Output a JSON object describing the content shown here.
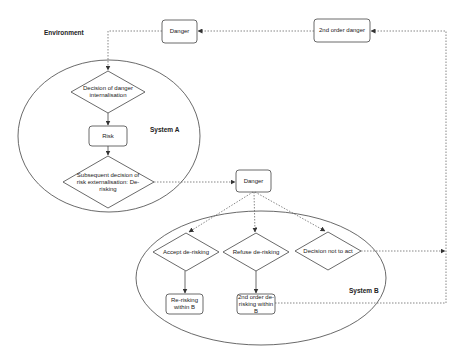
{
  "diagram": {
    "labels": {
      "environment": "Environment",
      "system_a": "System A",
      "system_b": "System B"
    },
    "nodes": {
      "danger_top": "Danger",
      "second_order_danger": "2nd order danger",
      "decision_internalisation": "Decision of danger internalisation",
      "risk": "Risk",
      "subsequent_decision": "Subsequent decision of risk externalisation: De-risking",
      "danger_mid": "Danger",
      "accept": "Accept de-risking",
      "refuse": "Refuse de-risking",
      "not_act": "Decision not to act",
      "re_risking": "Re-risking within B",
      "second_order_derisking": "2nd order de-risking within B"
    },
    "edges": [
      {
        "from": "second_order_danger",
        "to": "danger_top",
        "style": "dotted"
      },
      {
        "from": "danger_top",
        "to": "decision_internalisation",
        "style": "dotted"
      },
      {
        "from": "decision_internalisation",
        "to": "risk",
        "style": "solid"
      },
      {
        "from": "risk",
        "to": "subsequent_decision",
        "style": "solid"
      },
      {
        "from": "subsequent_decision",
        "to": "danger_mid",
        "style": "dotted"
      },
      {
        "from": "danger_mid",
        "to": "accept",
        "style": "dotted"
      },
      {
        "from": "danger_mid",
        "to": "refuse",
        "style": "dotted"
      },
      {
        "from": "danger_mid",
        "to": "not_act",
        "style": "dotted"
      },
      {
        "from": "accept",
        "to": "re_risking",
        "style": "solid"
      },
      {
        "from": "refuse",
        "to": "second_order_derisking",
        "style": "solid"
      },
      {
        "from": "not_act",
        "to": "second_order_danger",
        "style": "dotted"
      },
      {
        "from": "second_order_derisking",
        "to": "second_order_danger",
        "style": "dotted"
      }
    ],
    "colors": {
      "stroke": "#444444",
      "background": "#ffffff"
    }
  }
}
